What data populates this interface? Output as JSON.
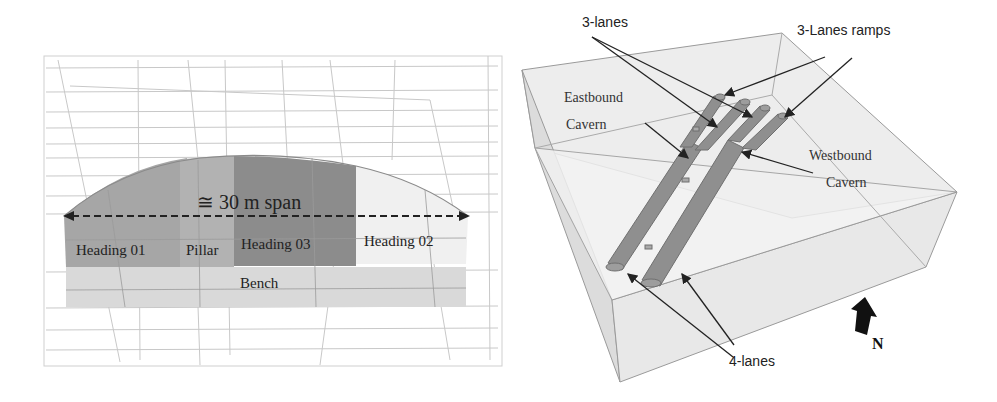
{
  "figure": {
    "left_panel": {
      "title": "Cavern excavation sequence cross-section",
      "span_label": "≅ 30 m span",
      "sections": [
        {
          "label": "Heading 01",
          "color": "#a6a6a6"
        },
        {
          "label": "Pillar",
          "color": "#b5b5b5"
        },
        {
          "label": "Heading 03",
          "color": "#8c8c8c"
        },
        {
          "label": "Heading 02",
          "color": "#efefef"
        },
        {
          "label": "Bench",
          "color": "#d9d9d9"
        }
      ]
    },
    "right_panel": {
      "title": "3D model of twin caverns",
      "labels": {
        "three_lanes": "3-lanes",
        "three_lanes_ramps": "3-Lanes ramps",
        "eastbound_line1": "Eastbound",
        "eastbound_line2": "Cavern",
        "westbound_line1": "Westbound",
        "westbound_line2": "Cavern",
        "four_lanes": "4-lanes",
        "north": "N"
      },
      "colors": {
        "tunnel": "#8f8f8f",
        "box_fill": "#ececec",
        "box_edge": "#9a9a9a"
      }
    }
  }
}
